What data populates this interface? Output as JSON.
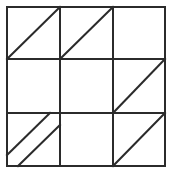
{
  "diagram": {
    "type": "grid-with-diagonals",
    "rows": 3,
    "cols": 3,
    "stroke_color": "#2b2b2b",
    "background": "#ffffff",
    "stroke_width": 2,
    "grid": {
      "x_lines": [
        7,
        60,
        113,
        165
      ],
      "y_lines": [
        7,
        59,
        113,
        166
      ]
    },
    "cells": [
      {
        "row": 0,
        "col": 0,
        "name": "cell-top-left",
        "diagonals": [
          {
            "x1": 7,
            "y1": 59,
            "x2": 60,
            "y2": 7
          }
        ]
      },
      {
        "row": 0,
        "col": 1,
        "name": "cell-top-center",
        "diagonals": [
          {
            "x1": 60,
            "y1": 59,
            "x2": 113,
            "y2": 7
          }
        ]
      },
      {
        "row": 0,
        "col": 2,
        "name": "cell-top-right",
        "diagonals": []
      },
      {
        "row": 1,
        "col": 0,
        "name": "cell-middle-left",
        "diagonals": []
      },
      {
        "row": 1,
        "col": 1,
        "name": "cell-center",
        "diagonals": []
      },
      {
        "row": 1,
        "col": 2,
        "name": "cell-middle-right",
        "diagonals": [
          {
            "x1": 113,
            "y1": 113,
            "x2": 165,
            "y2": 59
          }
        ]
      },
      {
        "row": 2,
        "col": 0,
        "name": "cell-bottom-left",
        "diagonals": [
          {
            "x1": 7,
            "y1": 155,
            "x2": 50,
            "y2": 113
          },
          {
            "x1": 18,
            "y1": 166,
            "x2": 60,
            "y2": 125
          }
        ]
      },
      {
        "row": 2,
        "col": 1,
        "name": "cell-bottom-center",
        "diagonals": []
      },
      {
        "row": 2,
        "col": 2,
        "name": "cell-bottom-right",
        "diagonals": [
          {
            "x1": 113,
            "y1": 166,
            "x2": 165,
            "y2": 113
          }
        ]
      }
    ]
  }
}
